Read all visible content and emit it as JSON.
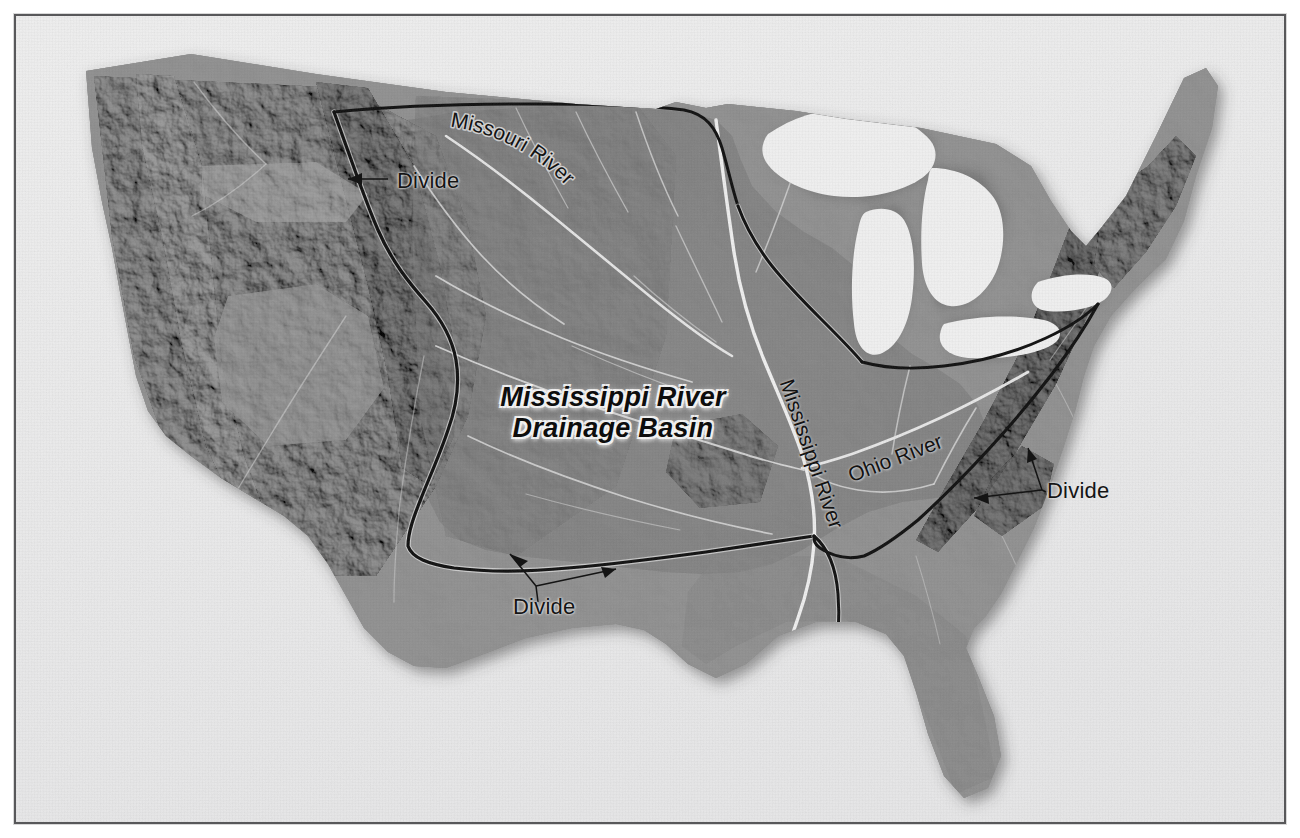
{
  "figure": {
    "kind": "shaded-relief-map",
    "region": "Conterminous United States",
    "title_line1": "Mississippi River",
    "title_line2": "Drainage Basin",
    "frame": {
      "mat_color": "#ececed",
      "border_color": "#58585a",
      "page_background": "#ffffff"
    }
  },
  "map": {
    "land_base_color": "#8d8d8d",
    "basin_fill_color": "#7e7e7e",
    "lake_color": "#f0f0f0",
    "ocean_color": "#ededed",
    "river_color": "#f2f2f2",
    "divide_color": "#111111",
    "shadow_color": "rgba(60,60,60,0.45)"
  },
  "labels": {
    "basin_title": {
      "line1": "Mississippi River",
      "line2": "Drainage Basin",
      "style": "bold-italic"
    },
    "rivers": [
      {
        "id": "missouri",
        "text": "Missouri River",
        "placement": "curved-arc",
        "rotation_deg": 40
      },
      {
        "id": "mississippi",
        "text": "Mississippi River",
        "placement": "rotated-inline",
        "rotation_deg": 71
      },
      {
        "id": "ohio",
        "text": "Ohio River",
        "placement": "rotated-inline",
        "rotation_deg": -21
      }
    ],
    "divides": [
      {
        "id": "divide-northwest",
        "text": "Divide",
        "arrows": 1,
        "points_to": "continental-divide-rocky-mountains"
      },
      {
        "id": "divide-south",
        "text": "Divide",
        "arrows": 2,
        "points_to": "southern-basin-boundary"
      },
      {
        "id": "divide-east",
        "text": "Divide",
        "arrows": 2,
        "points_to": "appalachian-eastern-boundary"
      }
    ]
  },
  "features": {
    "great_lakes": [
      "Lake Superior",
      "Lake Michigan",
      "Lake Huron",
      "Lake Erie",
      "Lake Ontario"
    ],
    "water_bodies": [
      "Gulf of Mexico",
      "Atlantic Ocean",
      "Pacific Ocean"
    ],
    "major_rivers": [
      "Missouri River",
      "Mississippi River",
      "Ohio River"
    ]
  }
}
